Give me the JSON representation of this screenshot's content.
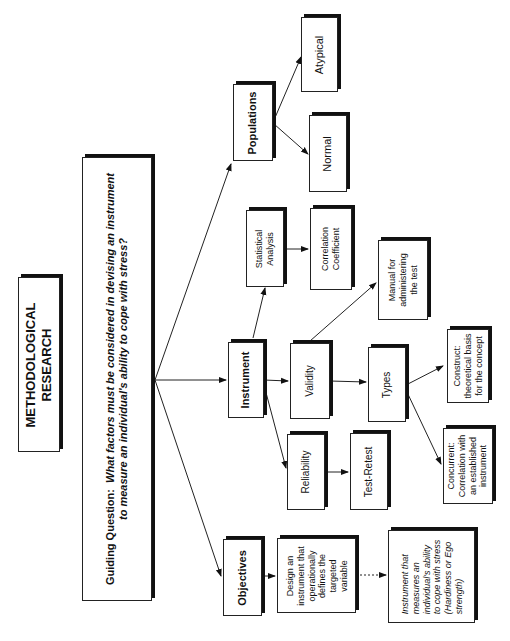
{
  "title": {
    "line1": "METHODOLOGICAL",
    "line2": "RESEARCH"
  },
  "guiding_question": {
    "label": "Guiding Question:",
    "line1": "What factors must be considered in devising an instrument",
    "line2": "to measure an individual's ability to cope with stress?"
  },
  "nodes": {
    "populations": "Populations",
    "atypical": "Atypical",
    "normal": "Normal",
    "instrument": "Instrument",
    "statistical_analysis": {
      "line1": "Statistical",
      "line2": "Analysis"
    },
    "correlation_coefficient": {
      "line1": "Correlation",
      "line2": "Coefficient"
    },
    "manual": {
      "line1": "Manual for",
      "line2": "administering",
      "line3": "the test"
    },
    "validity": "Validity",
    "types": "Types",
    "construct": {
      "line1": "Construct:",
      "line2": "theoretical basis",
      "line3": "for the concept"
    },
    "concurrent": {
      "line1": "Concurrent:",
      "line2": "Correlation with",
      "line3": "an established",
      "line4": "instrument"
    },
    "reliability": "Reliability",
    "test_retest": "Test-Retest",
    "objectives": "Objectives",
    "design": {
      "line1": "Design an",
      "line2": "instrument that",
      "line3": "operationally",
      "line4": "defines the",
      "line5": "targeted",
      "line6": "variable"
    },
    "outcome": {
      "line1": "Instrument that",
      "line2": "measures an",
      "line3": "individual's ability",
      "line4": "to cope with stress",
      "line5": "(Hardiness or Ego",
      "line6": "strength)"
    }
  }
}
